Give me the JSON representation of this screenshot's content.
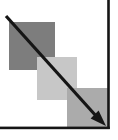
{
  "icon": {
    "name": "descending-cascade-arrow-pictogram",
    "colors": {
      "background": "#ffffff",
      "square_dark": "#7d7d7d",
      "square_light": "#c7c7c7",
      "square_medium": "#ababab",
      "arrow": "#151515",
      "frame": "#151515"
    },
    "geometry_note": ""
  }
}
